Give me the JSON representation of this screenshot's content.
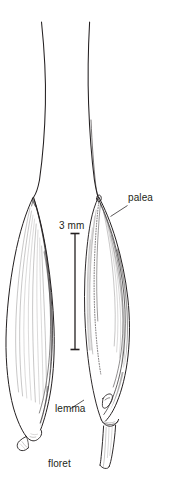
{
  "figure": {
    "title": "floret",
    "background_color": "#ffffff",
    "ink_color": "#231f20",
    "width": 170,
    "height": 500
  },
  "labels": {
    "palea": "palea",
    "lemma": "lemma",
    "floret": "floret"
  },
  "scale_bar": {
    "label": "3 mm",
    "value": 3,
    "unit": "mm",
    "orientation": "vertical",
    "top_y": 233,
    "bottom_y": 350,
    "x": 75
  },
  "specimens": [
    {
      "name": "floret-left",
      "view": "lemma-side",
      "has_awn": true,
      "awn_top_y": 22,
      "body_top_y": 197,
      "body_bottom_y": 437,
      "callus": "pointed"
    },
    {
      "name": "floret-right",
      "view": "palea-side",
      "has_awn": true,
      "awn_top_y": 22,
      "body_top_y": 197,
      "body_bottom_y": 432,
      "callus": "stalked-pedicel"
    }
  ],
  "icons": {
    "scale_bar": "scale-bar-icon",
    "leader_line": "leader-line-icon"
  }
}
